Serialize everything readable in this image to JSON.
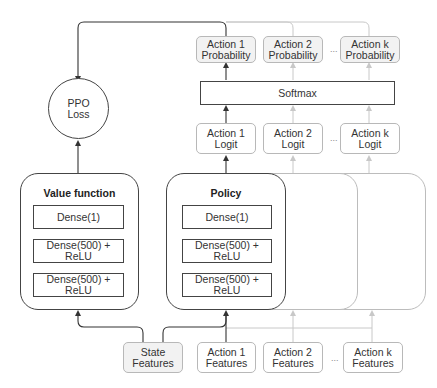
{
  "diagram": {
    "loss": {
      "line1": "PPO",
      "line2": "Loss"
    },
    "value_function": {
      "title": "Value function",
      "layers": [
        "Dense(1)",
        "Dense(500) + ReLU",
        "Dense(500) + ReLU"
      ]
    },
    "policy": {
      "title": "Policy",
      "layers": [
        "Dense(1)",
        "Dense(500) + ReLU",
        "Dense(500) + ReLU"
      ]
    },
    "softmax": {
      "label": "Softmax"
    },
    "probabilities": [
      {
        "line1": "Action 1",
        "line2": "Probability"
      },
      {
        "line1": "Action 2",
        "line2": "Probability"
      },
      {
        "line1": "Action k",
        "line2": "Probability"
      }
    ],
    "logits": [
      {
        "line1": "Action 1",
        "line2": "Logit"
      },
      {
        "line1": "Action 2",
        "line2": "Logit"
      },
      {
        "line1": "Action k",
        "line2": "Logit"
      }
    ],
    "features": {
      "state": {
        "line1": "State",
        "line2": "Features"
      },
      "actions": [
        {
          "line1": "Action 1",
          "line2": "Features"
        },
        {
          "line1": "Action 2",
          "line2": "Features"
        },
        {
          "line1": "Action k",
          "line2": "Features"
        }
      ]
    },
    "ellipsis": "...",
    "colors": {
      "edge_dark": "#333333",
      "edge_light": "#c4c4c4",
      "box_shaded": "#f2f2f2",
      "box_border": "#b8b8b8"
    }
  }
}
